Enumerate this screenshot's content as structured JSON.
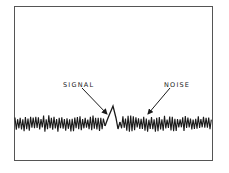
{
  "diagram": {
    "labels": {
      "signal": "SIGNAL",
      "noise": "NOISE"
    },
    "colors": {
      "ink": "#1a1a1a",
      "frame": "#555555",
      "background": "#ffffff"
    },
    "signal_peak": {
      "x": 113,
      "y": 106
    },
    "noise_band": {
      "y_top": 116,
      "y_bottom": 131,
      "x_start": 15,
      "x_end": 212
    }
  }
}
